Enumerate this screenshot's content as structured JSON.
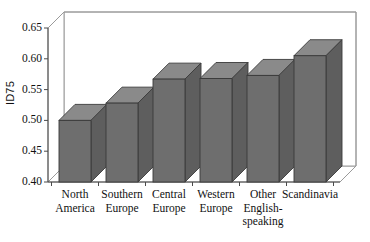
{
  "chart_data": {
    "type": "bar",
    "title": "",
    "subtitle": "",
    "xlabel": "",
    "ylabel": "ID75",
    "categories": [
      "North\nAmerica",
      "Southern\nEurope",
      "Central\nEurope",
      "Western\nEurope",
      "Other\nEnglish-\nspeaking",
      "Scandinavia"
    ],
    "values": [
      0.5,
      0.528,
      0.567,
      0.568,
      0.573,
      0.605
    ],
    "ylim": [
      0.4,
      0.65
    ],
    "yticks": [
      0.4,
      0.45,
      0.5,
      0.55,
      0.6,
      0.65
    ],
    "ytick_labels": [
      "0.40",
      "0.45",
      "0.50",
      "0.55",
      "0.60",
      "0.65"
    ],
    "grid": false,
    "legend": "none",
    "style": "3d-bar",
    "bar_color": "#6e6e6e",
    "bar_top_color": "#8a8a8a",
    "bar_side_color": "#5e5e5e",
    "bar_edge_color": "#3a3a3a",
    "plot_background": "#ffffff",
    "frame_color": "#9a9a9a",
    "axis_color": "#4a4a4a"
  },
  "geometry": {
    "plot_left": 48,
    "plot_right": 340,
    "plot_top": 28,
    "plot_bottom": 182,
    "depth_x": 16,
    "depth_y": -16,
    "bar_width": 32,
    "bar_gap": 15,
    "first_bar_left": 59
  }
}
